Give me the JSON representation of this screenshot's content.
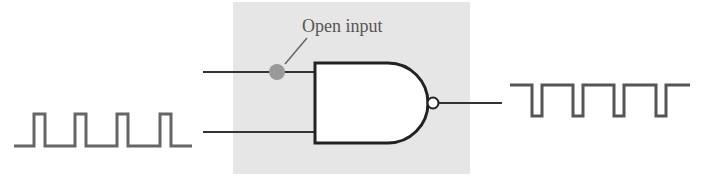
{
  "diagram": {
    "annotation": {
      "text": "Open input"
    },
    "colors": {
      "panel": "#e6e6e6",
      "wire": "#333333",
      "waveform": "#666666",
      "open_dot": "#9a9a9a",
      "gate_fill": "#ffffff",
      "label": "#555555"
    },
    "gate": {
      "type": "NAND",
      "inputs": 2,
      "outputs": 1
    },
    "input_waveform": {
      "description": "pulse train",
      "pulses": 4,
      "level": "active-high pulses"
    },
    "output_waveform": {
      "description": "inverted pulse train",
      "pulses": 4,
      "level": "active-low pulses"
    }
  }
}
